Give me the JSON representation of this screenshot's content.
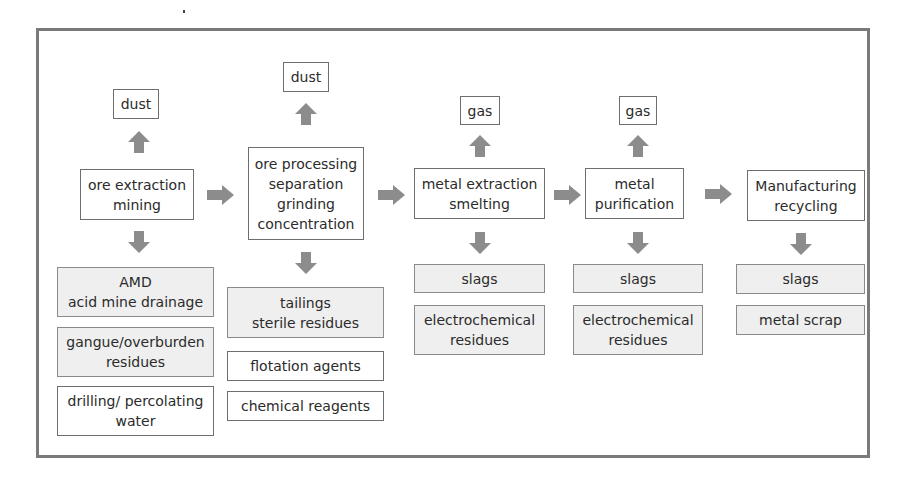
{
  "diagram": {
    "title": "",
    "arrow_color": "#8c8c8c",
    "box_border_color": "#6e6e6e",
    "shaded_fill": "#efefef",
    "stages": [
      {
        "label": "ore extraction\nmining",
        "emission": "dust",
        "outputs": [
          {
            "label": "AMD\nacid mine drainage",
            "shaded": true
          },
          {
            "label": "gangue/overburden\nresidues",
            "shaded": true
          },
          {
            "label": "drilling/ percolating\nwater",
            "shaded": false
          }
        ]
      },
      {
        "label": "ore processing\nseparation\ngrinding\nconcentration",
        "emission": "dust",
        "outputs": [
          {
            "label": "tailings\nsterile residues",
            "shaded": true
          },
          {
            "label": "flotation agents",
            "shaded": false
          },
          {
            "label": "chemical reagents",
            "shaded": false
          }
        ]
      },
      {
        "label": "metal extraction\nsmelting",
        "emission": "gas",
        "outputs": [
          {
            "label": "slags",
            "shaded": true
          },
          {
            "label": "electrochemical\nresidues",
            "shaded": true
          }
        ]
      },
      {
        "label": "metal\npurification",
        "emission": "gas",
        "outputs": [
          {
            "label": "slags",
            "shaded": true
          },
          {
            "label": "electrochemical\nresidues",
            "shaded": true
          }
        ]
      },
      {
        "label": "Manufacturing\nrecycling",
        "emission": null,
        "outputs": [
          {
            "label": "slags",
            "shaded": true
          },
          {
            "label": "metal scrap",
            "shaded": true
          }
        ]
      }
    ]
  }
}
